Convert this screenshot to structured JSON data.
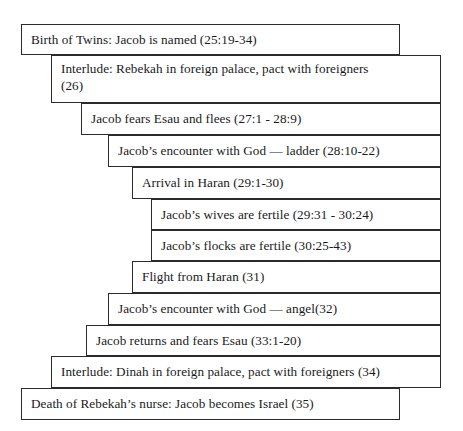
{
  "diagram": {
    "type": "staircase-chiasm",
    "background_color": "#ffffff",
    "border_color": "#2b2b2b",
    "text_color": "#1a1a1a",
    "boxes": [
      {
        "id": "box-1",
        "label": "Birth of Twins: Jacob is named (25:19-34)",
        "reference": "25:19-34",
        "level": 1,
        "x": 21,
        "y": 24,
        "width": 379,
        "height": 31
      },
      {
        "id": "box-2",
        "label": "Interlude: Rebekah in foreign palace, pact with foreigners\n(26)",
        "reference": "26",
        "level": 2,
        "x": 51,
        "y": 55,
        "width": 390,
        "height": 48
      },
      {
        "id": "box-3",
        "label": "Jacob fears Esau and flees (27:1 - 28:9)",
        "reference": "27:1 - 28:9",
        "level": 3,
        "x": 81,
        "y": 103,
        "width": 360,
        "height": 32
      },
      {
        "id": "box-4",
        "label": "Jacob’s encounter with God — ladder (28:10-22)",
        "reference": "28:10-22",
        "level": 4,
        "x": 108,
        "y": 135,
        "width": 333,
        "height": 32
      },
      {
        "id": "box-5",
        "label": "Arrival in Haran (29:1-30)",
        "reference": "29:1-30",
        "level": 5,
        "x": 132,
        "y": 167,
        "width": 309,
        "height": 32
      },
      {
        "id": "box-6",
        "label": "Jacob’s wives are fertile (29:31 - 30:24)",
        "reference": "29:31 - 30:24",
        "level": 6,
        "x": 151,
        "y": 199,
        "width": 290,
        "height": 31
      },
      {
        "id": "box-7",
        "label": "Jacob’s flocks are fertile (30:25-43)",
        "reference": "30:25-43",
        "level": 6,
        "x": 151,
        "y": 230,
        "width": 290,
        "height": 31
      },
      {
        "id": "box-8",
        "label": "Flight from Haran (31)",
        "reference": "31",
        "level": 5,
        "x": 132,
        "y": 261,
        "width": 309,
        "height": 32
      },
      {
        "id": "box-9",
        "label": "Jacob’s encounter with God — angel(32)",
        "reference": "32",
        "level": 4,
        "x": 108,
        "y": 293,
        "width": 333,
        "height": 32
      },
      {
        "id": "box-10",
        "label": "Jacob returns and fears Esau (33:1-20)",
        "reference": "33:1-20",
        "level": 3,
        "x": 86,
        "y": 325,
        "width": 355,
        "height": 31
      },
      {
        "id": "box-11",
        "label": "Interlude: Dinah in foreign palace, pact with foreigners (34)",
        "reference": "34",
        "level": 2,
        "x": 51,
        "y": 356,
        "width": 390,
        "height": 32
      },
      {
        "id": "box-12",
        "label": "Death of Rebekah’s nurse: Jacob becomes Israel (35)",
        "reference": "35",
        "level": 1,
        "x": 21,
        "y": 388,
        "width": 379,
        "height": 32
      }
    ]
  }
}
